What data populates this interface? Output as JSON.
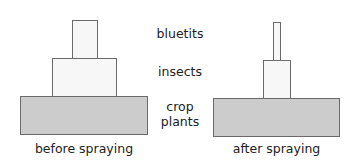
{
  "pyramids": {
    "before": {
      "caption": "before spraying",
      "levels": [
        {
          "name": "bluetits",
          "width": 26,
          "height": 38
        },
        {
          "name": "insects",
          "width": 64,
          "height": 38
        },
        {
          "name": "crop plants",
          "width": 127,
          "height": 38
        }
      ]
    },
    "after": {
      "caption": "after spraying",
      "levels": [
        {
          "name": "bluetits",
          "width": 8,
          "height": 38
        },
        {
          "name": "insects",
          "width": 28,
          "height": 38
        },
        {
          "name": "crop plants",
          "width": 126,
          "height": 38
        }
      ]
    }
  },
  "labels": {
    "top": "bluetits",
    "middle": "insects",
    "bottom_line1": "crop",
    "bottom_line2": "plants"
  },
  "colors": {
    "light": "#f7f7f7",
    "base": "#cccccc",
    "border": "#6a6a6a"
  }
}
